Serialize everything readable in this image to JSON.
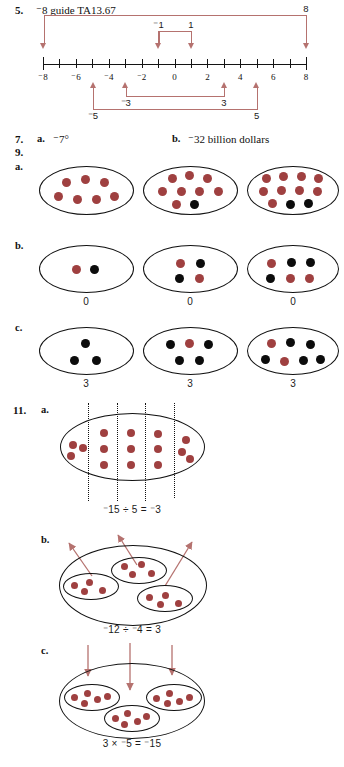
{
  "page": {
    "width": 344,
    "height": 767,
    "background": "#ffffff",
    "counter_red": "#9f4040",
    "counter_black": "#0c0c0c",
    "arrow_red": "#b5726f",
    "ink": "#111111"
  },
  "problem5": {
    "number": "5.",
    "answer_prefix_minus": "⁻",
    "answer": "8 guide TA13.67",
    "answer_full": "⁻8 guide TA13.67",
    "number_line": {
      "min": -8,
      "max": 8,
      "tick_values": [
        -8,
        -7,
        -6,
        -5,
        -4,
        -3,
        -2,
        -1,
        0,
        1,
        2,
        3,
        4,
        5,
        6,
        7,
        8
      ],
      "labeled_ticks": [
        {
          "value": -8,
          "label": "⁻8"
        },
        {
          "value": -6,
          "label": "⁻6"
        },
        {
          "value": -4,
          "label": "⁻4"
        },
        {
          "value": -2,
          "label": "⁻2"
        },
        {
          "value": 0,
          "label": "0"
        },
        {
          "value": 2,
          "label": "2"
        },
        {
          "value": 4,
          "label": "4"
        },
        {
          "value": 6,
          "label": "6"
        },
        {
          "value": 8,
          "label": "8"
        }
      ],
      "above_brackets": [
        {
          "from": -8,
          "to": 8,
          "label": "8",
          "label_at": 8,
          "arrows": "down"
        },
        {
          "from": -1,
          "to": 1,
          "label_left": "⁻1",
          "label_right": "1",
          "arrows": "down"
        }
      ],
      "below_brackets": [
        {
          "from": -5,
          "to": 5,
          "label_left": "⁻5",
          "label_right": "5",
          "arrows": "up"
        },
        {
          "from": -3,
          "to": 3,
          "label_left": "⁻3",
          "label_right": "3",
          "arrows": "up"
        }
      ],
      "down_arrow_positions": [
        -8,
        -1,
        1,
        8
      ],
      "up_arrow_positions": [
        -5,
        -3,
        3,
        5
      ],
      "bracket_labels": {
        "top_right": "8",
        "top_inner_left": "⁻1",
        "top_inner_right": "1",
        "bottom_inner_left": "⁻3",
        "bottom_inner_right": "3",
        "bottom_outer_left": "⁻5",
        "bottom_outer_right": "5"
      }
    }
  },
  "problem7": {
    "number": "7.",
    "parts": [
      {
        "label": "a.",
        "answer": "⁻7°"
      },
      {
        "label": "b.",
        "answer": "⁻32 billion dollars"
      }
    ]
  },
  "problem9": {
    "number": "9.",
    "parts": [
      {
        "label": "a.",
        "ovals": [
          {
            "red": 7,
            "black": 0,
            "caption": ""
          },
          {
            "red": 8,
            "black": 1,
            "caption": ""
          },
          {
            "red": 9,
            "black": 2,
            "caption": ""
          }
        ]
      },
      {
        "label": "b.",
        "ovals": [
          {
            "red": 1,
            "black": 1,
            "caption": "0"
          },
          {
            "red": 2,
            "black": 2,
            "caption": "0"
          },
          {
            "red": 3,
            "black": 3,
            "caption": "0"
          }
        ]
      },
      {
        "label": "c.",
        "ovals": [
          {
            "red": 0,
            "black": 3,
            "caption": "3"
          },
          {
            "red": 1,
            "black": 5,
            "caption": "3"
          },
          {
            "red": 2,
            "black": 5,
            "caption": "3"
          }
        ]
      }
    ]
  },
  "problem11": {
    "number": "11.",
    "parts": [
      {
        "label": "a.",
        "equation": "⁻15 ÷ 5 = ⁻3",
        "model": "one large oval with 15 red counters split by 4 dotted lines into 5 groups of 3",
        "total_red": 15,
        "groups": 5,
        "per_group": 3,
        "divider_count": 4
      },
      {
        "label": "b.",
        "equation": "⁻12 ÷ ⁻4 = 3",
        "model": "large oval containing 3 small ovals of 4 red counters each, 3 arrows pointing out",
        "total_red": 12,
        "groups": 3,
        "per_group": 4,
        "arrow_count": 3,
        "arrow_direction": "out"
      },
      {
        "label": "c.",
        "equation": "3 × ⁻5 = ⁻15",
        "model": "large oval containing 3 small ovals of 5 red counters each, 3 arrows pointing in",
        "total_red": 15,
        "groups": 3,
        "per_group": 5,
        "arrow_count": 3,
        "arrow_direction": "in"
      }
    ]
  }
}
